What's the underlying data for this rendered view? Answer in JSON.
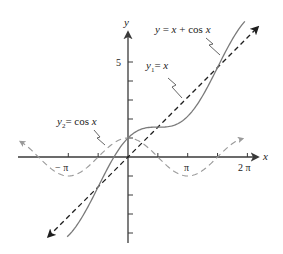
{
  "chart_data": {
    "type": "line",
    "title": "",
    "xlabel": "x",
    "ylabel": "y",
    "xlim": [
      -5.8,
      6.95
    ],
    "ylim": [
      -4.6,
      6.6
    ],
    "grid": false,
    "legend": "none (inline labels with leader lines)",
    "x_ticks": [
      {
        "value": -3.14159,
        "label": "−π"
      },
      {
        "value": -1.5708,
        "label": ""
      },
      {
        "value": 1.5708,
        "label": ""
      },
      {
        "value": 3.14159,
        "label": "π"
      },
      {
        "value": 4.71239,
        "label": ""
      },
      {
        "value": 6.28319,
        "label": "2π"
      }
    ],
    "y_ticks": [
      {
        "value": 1,
        "label": ""
      },
      {
        "value": 2,
        "label": ""
      },
      {
        "value": 3,
        "label": ""
      },
      {
        "value": 4,
        "label": ""
      },
      {
        "value": 5,
        "label": "5"
      },
      {
        "value": -1,
        "label": ""
      },
      {
        "value": -2,
        "label": ""
      },
      {
        "value": -3,
        "label": ""
      },
      {
        "value": -4,
        "label": ""
      }
    ],
    "series": [
      {
        "name": "y = x + cos x",
        "function": "x + cos(x)",
        "x_range": [
          -3.2,
          6.15
        ],
        "style": "solid",
        "color": "#7a7a7a"
      },
      {
        "name": "y1 = x",
        "function": "x",
        "x_range": [
          -4.2,
          6.84
        ],
        "style": "dashed with arrows",
        "color": "#1e1e1e"
      },
      {
        "name": "y2 = cos x",
        "function": "cos(x)",
        "x_range": [
          -5.68,
          6.05
        ],
        "style": "dashed with arrows",
        "color": "#9a9a9a"
      }
    ],
    "annotations": [
      {
        "text": "y = x + cos x",
        "position": "upper right"
      },
      {
        "text": "y1 = x",
        "position": "upper middle"
      },
      {
        "text": "y2 = cos x",
        "position": "left"
      }
    ]
  },
  "labels": {
    "y_axis": "y",
    "x_axis": "x",
    "y5": "5",
    "neg_pi": "− π",
    "pi": "π",
    "two_pi": "2 π",
    "sum_label_y": "y",
    "sum_label_eq": " = ",
    "sum_label_rest1": "x",
    "sum_label_plus": " + cos ",
    "sum_label_rest2": "x",
    "y1_label_y": "y",
    "y1_label_sub": "1",
    "y1_label_eq": "= ",
    "y1_label_x": "x",
    "y2_label_y": "y",
    "y2_label_sub": "2",
    "y2_label_eq": "= cos ",
    "y2_label_x": "x"
  }
}
